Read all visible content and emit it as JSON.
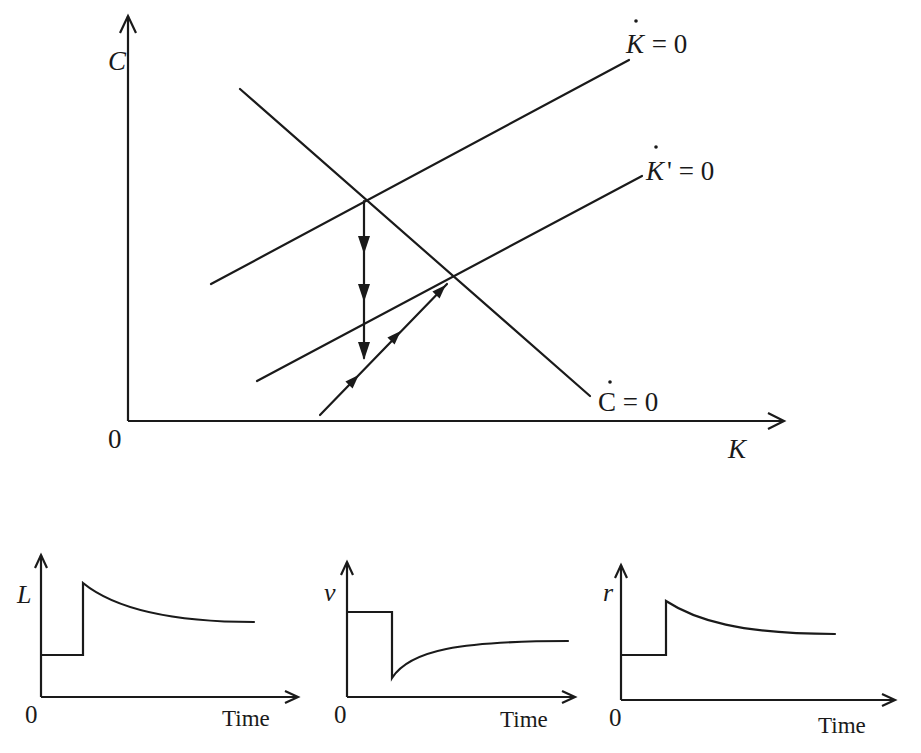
{
  "main_diagram": {
    "y_axis_label": "C",
    "x_axis_label": "K",
    "origin_label": "0",
    "curves": [
      {
        "id": "k_dot_zero",
        "label_var": "K",
        "label_rest": " = 0",
        "dotted": true,
        "description": "capital-accumulation locus (original)"
      },
      {
        "id": "k_dot_prime_zero",
        "label_var": "K",
        "label_prime": "'",
        "label_rest": " = 0",
        "dotted": true,
        "description": "capital-accumulation locus (shifted down)"
      },
      {
        "id": "c_dot_zero",
        "label_var": "C",
        "label_rest": " = 0",
        "dotted": true,
        "description": "consumption locus (downward sloping)"
      }
    ],
    "paths": [
      {
        "id": "jump_down",
        "description": "vertical drop in C at old steady state",
        "arrowheads": 3,
        "direction": "down"
      },
      {
        "id": "saddle_path",
        "description": "saddle path toward new steady state",
        "arrowheads": 3,
        "direction": "up-right"
      }
    ]
  },
  "panels": [
    {
      "id": "labor",
      "y_label": "L",
      "x_label": "Time",
      "origin_label": "0",
      "shape": "step up then decay to level above initial"
    },
    {
      "id": "wage",
      "y_label": "v",
      "x_label": "Time",
      "origin_label": "0",
      "shape": "step down then recover to level below initial"
    },
    {
      "id": "interest",
      "y_label": "r",
      "x_label": "Time",
      "origin_label": "0",
      "shape": "step up then decay to level above initial"
    }
  ]
}
